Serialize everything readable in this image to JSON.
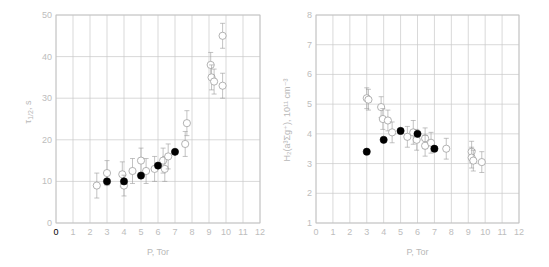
{
  "chart_data": [
    {
      "type": "scatter",
      "title": "",
      "xlabel": "P, Tor",
      "ylabel": "τ1/2, s",
      "xlim": [
        0,
        12
      ],
      "ylim": [
        0,
        50
      ],
      "xticks": [
        "0",
        "1",
        "2",
        "3",
        "4",
        "5",
        "6",
        "7",
        "8",
        "9",
        "10",
        "11",
        "12"
      ],
      "yticks": [
        "0",
        "10",
        "20",
        "30",
        "40",
        "50"
      ],
      "grid": true,
      "series": [
        {
          "name": "open",
          "marker": "open-circle",
          "points": [
            {
              "x": 2.4,
              "y": 9,
              "err": 3
            },
            {
              "x": 3.0,
              "y": 12,
              "err": 3
            },
            {
              "x": 3.9,
              "y": 11.7,
              "err": 3
            },
            {
              "x": 4.0,
              "y": 9,
              "err": 2.5
            },
            {
              "x": 4.5,
              "y": 12.5,
              "err": 3
            },
            {
              "x": 5.0,
              "y": 15,
              "err": 3
            },
            {
              "x": 5.3,
              "y": 12.5,
              "err": 3
            },
            {
              "x": 5.8,
              "y": 13,
              "err": 3
            },
            {
              "x": 6.3,
              "y": 15,
              "err": 3
            },
            {
              "x": 6.4,
              "y": 13,
              "err": 3
            },
            {
              "x": 6.6,
              "y": 16,
              "err": 3
            },
            {
              "x": 7.6,
              "y": 19,
              "err": 3
            },
            {
              "x": 7.7,
              "y": 24,
              "err": 3
            },
            {
              "x": 9.1,
              "y": 38,
              "err": 3
            },
            {
              "x": 9.15,
              "y": 35,
              "err": 3
            },
            {
              "x": 9.3,
              "y": 34,
              "err": 3
            },
            {
              "x": 9.8,
              "y": 45,
              "err": 3
            },
            {
              "x": 9.8,
              "y": 33,
              "err": 3
            }
          ]
        },
        {
          "name": "filled",
          "marker": "filled-circle",
          "points": [
            {
              "x": 3,
              "y": 10
            },
            {
              "x": 4,
              "y": 10
            },
            {
              "x": 5,
              "y": 11.4
            },
            {
              "x": 6,
              "y": 13.8
            },
            {
              "x": 7,
              "y": 17.1
            }
          ]
        }
      ]
    },
    {
      "type": "scatter",
      "title": "",
      "xlabel": "P, Tor",
      "ylabel": "H2(a3Σg+), 10^11 cm^-3",
      "xlim": [
        0,
        12
      ],
      "ylim": [
        1,
        8
      ],
      "xticks": [
        "0",
        "1",
        "2",
        "3",
        "4",
        "5",
        "6",
        "7",
        "8",
        "9",
        "10",
        "11",
        "12"
      ],
      "yticks": [
        "1",
        "2",
        "3",
        "4",
        "5",
        "6",
        "7",
        "8"
      ],
      "grid": true,
      "series": [
        {
          "name": "open",
          "marker": "open-circle",
          "points": [
            {
              "x": 3.0,
              "y": 5.2,
              "err": 0.35
            },
            {
              "x": 3.1,
              "y": 5.15,
              "err": 0.35
            },
            {
              "x": 3.85,
              "y": 4.9,
              "err": 0.35
            },
            {
              "x": 3.95,
              "y": 4.5,
              "err": 0.35
            },
            {
              "x": 4.25,
              "y": 4.45,
              "err": 0.35
            },
            {
              "x": 4.5,
              "y": 4.05,
              "err": 0.35
            },
            {
              "x": 5.4,
              "y": 3.9,
              "err": 0.35
            },
            {
              "x": 5.75,
              "y": 4.05,
              "err": 0.4
            },
            {
              "x": 5.95,
              "y": 3.8,
              "err": 0.35
            },
            {
              "x": 6.45,
              "y": 3.85,
              "err": 0.35
            },
            {
              "x": 6.45,
              "y": 3.6,
              "err": 0.35
            },
            {
              "x": 6.8,
              "y": 3.7,
              "err": 0.35
            },
            {
              "x": 7.7,
              "y": 3.5,
              "err": 0.35
            },
            {
              "x": 9.2,
              "y": 3.4,
              "err": 0.35
            },
            {
              "x": 9.2,
              "y": 3.2,
              "err": 0.35
            },
            {
              "x": 9.3,
              "y": 3.1,
              "err": 0.35
            },
            {
              "x": 9.8,
              "y": 3.05,
              "err": 0.35
            }
          ]
        },
        {
          "name": "filled",
          "marker": "filled-circle",
          "points": [
            {
              "x": 3,
              "y": 3.4
            },
            {
              "x": 4,
              "y": 3.8
            },
            {
              "x": 5,
              "y": 4.1
            },
            {
              "x": 6,
              "y": 4.0
            },
            {
              "x": 7,
              "y": 3.5
            }
          ]
        }
      ]
    }
  ],
  "charts": {
    "left": {
      "xlabel": "P, Tor",
      "ylabel_main": "τ",
      "ylabel_sub": "1/2",
      "ylabel_unit": ", s"
    },
    "right": {
      "xlabel": "P, Tor",
      "ylabel": "H₂(a³Σg⁺), 10¹¹ cm⁻³"
    }
  }
}
